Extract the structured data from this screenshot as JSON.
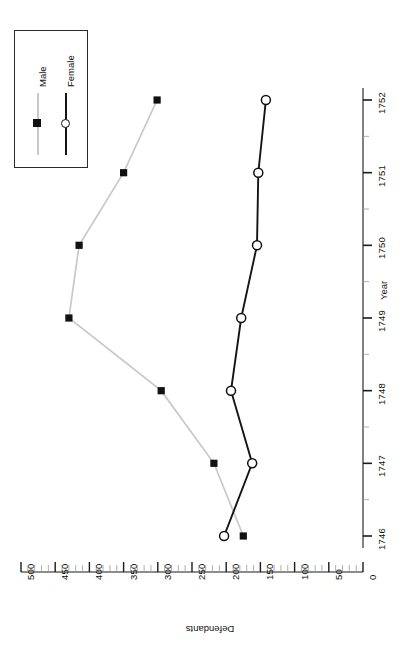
{
  "chart_data": {
    "type": "line",
    "title": "",
    "orientation": "rotated-90",
    "xlabel": "Year",
    "ylabel": "Defendants",
    "x": [
      1746,
      1747,
      1748,
      1749,
      1750,
      1751,
      1752
    ],
    "xtick_labels": [
      "1746",
      "1747",
      "1748",
      "1749",
      "1750",
      "1751",
      "1752"
    ],
    "ylim": [
      0,
      500
    ],
    "ytick_labels": [
      "500",
      "450",
      "400",
      "350",
      "300",
      "250",
      "200",
      "150",
      "100",
      "50",
      "0"
    ],
    "ytick_values": [
      500,
      450,
      400,
      350,
      300,
      250,
      200,
      150,
      100,
      50,
      0
    ],
    "ytick_minor_step": 10,
    "grid": false,
    "legend_position": "top-left",
    "series": [
      {
        "name": "Male",
        "color": "#c8c8c8",
        "marker": "filled-square",
        "marker_color": "#111111",
        "values": [
          175,
          218,
          295,
          430,
          415,
          350,
          301
        ]
      },
      {
        "name": "Female",
        "color": "#141414",
        "marker": "open-circle",
        "marker_color": "#111111",
        "values": [
          203,
          162,
          193,
          178,
          155,
          153,
          142
        ]
      }
    ]
  },
  "legend": {
    "entries": [
      {
        "label": "Male"
      },
      {
        "label": "Female"
      }
    ]
  },
  "axes": {
    "year": {
      "title": "Year"
    },
    "defendants": {
      "title": "Defendants"
    }
  }
}
